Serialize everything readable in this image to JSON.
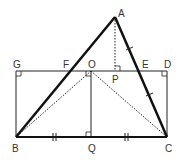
{
  "diagram": {
    "type": "geometry",
    "points": {
      "A": {
        "label": "A",
        "x": 115,
        "y": 17
      },
      "B": {
        "label": "B",
        "x": 16,
        "y": 137
      },
      "C": {
        "label": "C",
        "x": 167,
        "y": 137
      },
      "D": {
        "label": "D",
        "x": 167,
        "y": 71
      },
      "G": {
        "label": "G",
        "x": 16,
        "y": 71
      },
      "F": {
        "label": "F",
        "x": 69,
        "y": 71
      },
      "O": {
        "label": "O",
        "x": 91,
        "y": 71
      },
      "P": {
        "label": "P",
        "x": 115,
        "y": 71
      },
      "E": {
        "label": "E",
        "x": 143,
        "y": 71
      },
      "Q": {
        "label": "Q",
        "x": 91,
        "y": 137
      }
    },
    "segments": {
      "triangle": [
        "AB",
        "AC",
        "BC"
      ],
      "rectangle": [
        "GD",
        "DC",
        "GB"
      ],
      "OQ": "OQ",
      "dotted": [
        "AP",
        "OB",
        "OC"
      ]
    },
    "right_angles": [
      "G",
      "D",
      "O",
      "P",
      "Q"
    ],
    "equal_marks": {
      "single_tick": [
        "AE",
        "EC"
      ],
      "double_tick": [
        "BQ",
        "QC"
      ]
    }
  }
}
